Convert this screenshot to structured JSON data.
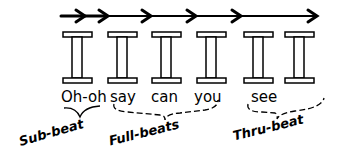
{
  "lyrics": [
    "Oh-oh",
    "say",
    "can",
    "you",
    "see"
  ],
  "labels": {
    "sub_beat": "Sub-beat",
    "full_beats": "Full-beats",
    "thru_beat": "Thru-beat"
  },
  "pillars": 6,
  "arrows": 6
}
